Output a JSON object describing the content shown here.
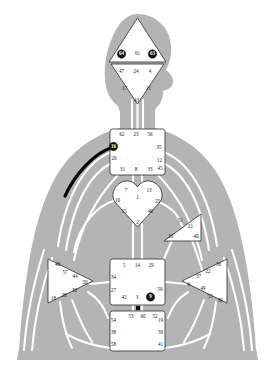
{
  "diagram": {
    "type": "bodygraph",
    "background_color": "#ffffff",
    "silhouette_color": "#b4b4b4",
    "center_fill": "#ffffff",
    "center_stroke": "#2b2b2b",
    "open_channel_color": "#ffffff",
    "defined_channel_color": "#000000",
    "defined_gate_fill": "#111111",
    "defined_gate_text": "#ffffff"
  },
  "centers": [
    {
      "id": "head",
      "name": "Head Center",
      "shape": "triangle-up",
      "defined": false,
      "gates": [
        {
          "num": "64",
          "x": 121.5,
          "y": 54.0,
          "on": true
        },
        {
          "num": "61",
          "x": 137.5,
          "y": 54.0,
          "on": false
        },
        {
          "num": "63",
          "x": 152.5,
          "y": 54.0,
          "on": true
        }
      ]
    },
    {
      "id": "ajna",
      "name": "Ajna Center",
      "shape": "triangle-down",
      "defined": false,
      "gates": [
        {
          "num": "47",
          "x": 121.5,
          "y": 71.5,
          "on": false
        },
        {
          "num": "24",
          "x": 136.0,
          "y": 71.5,
          "on": false
        },
        {
          "num": "4",
          "x": 150.0,
          "y": 71.5,
          "on": false
        },
        {
          "num": "17",
          "x": 124.5,
          "y": 88.5,
          "on": false
        },
        {
          "num": "11",
          "x": 148.5,
          "y": 88.5,
          "on": false
        },
        {
          "num": "43",
          "x": 136.5,
          "y": 100.5,
          "on": false
        }
      ]
    },
    {
      "id": "throat",
      "name": "Throat Center",
      "shape": "square",
      "defined": false,
      "gates": [
        {
          "num": "62",
          "x": 122.0,
          "y": 135.0,
          "on": false
        },
        {
          "num": "23",
          "x": 136.0,
          "y": 135.0,
          "on": false
        },
        {
          "num": "56",
          "x": 150.0,
          "y": 135.0,
          "on": false
        },
        {
          "num": "16",
          "x": 113.5,
          "y": 146.5,
          "on": true
        },
        {
          "num": "35",
          "x": 159.0,
          "y": 147.5,
          "on": false
        },
        {
          "num": "20",
          "x": 114.0,
          "y": 158.5,
          "on": false
        },
        {
          "num": "12",
          "x": 159.5,
          "y": 160.5,
          "on": false
        },
        {
          "num": "45",
          "x": 160.0,
          "y": 168.5,
          "on": false
        },
        {
          "num": "31",
          "x": 122.5,
          "y": 169.5,
          "on": false
        },
        {
          "num": "8",
          "x": 136.0,
          "y": 169.5,
          "on": false
        },
        {
          "num": "33",
          "x": 150.0,
          "y": 169.5,
          "on": false
        }
      ]
    },
    {
      "id": "g",
      "name": "G Center / Identity",
      "shape": "diamond-heart",
      "defined": false,
      "gates": [
        {
          "num": "7",
          "x": 126.0,
          "y": 190.5,
          "on": false
        },
        {
          "num": "13",
          "x": 149.0,
          "y": 190.5,
          "on": false
        },
        {
          "num": "1",
          "x": 137.5,
          "y": 197.5,
          "on": false
        },
        {
          "num": "10",
          "x": 117.5,
          "y": 201.0,
          "on": false
        },
        {
          "num": "25",
          "x": 157.5,
          "y": 201.5,
          "on": false
        },
        {
          "num": "15",
          "x": 124.0,
          "y": 211.5,
          "on": false
        },
        {
          "num": "46",
          "x": 150.5,
          "y": 211.5,
          "on": false
        },
        {
          "num": "2",
          "x": 137.5,
          "y": 222.5,
          "on": false
        }
      ]
    },
    {
      "id": "will",
      "name": "Heart / Ego Center",
      "shape": "triangle-left",
      "defined": false,
      "gates": [
        {
          "num": "51",
          "x": 180.5,
          "y": 220.5,
          "on": false
        },
        {
          "num": "21",
          "x": 190.5,
          "y": 227.0,
          "on": false
        },
        {
          "num": "26",
          "x": 170.5,
          "y": 236.5,
          "on": false
        },
        {
          "num": "40",
          "x": 196.0,
          "y": 236.5,
          "on": false
        }
      ]
    },
    {
      "id": "spleen",
      "name": "Spleen Center",
      "shape": "triangle-right",
      "defined": false,
      "gates": [
        {
          "num": "48",
          "x": 57.5,
          "y": 264.5,
          "on": false
        },
        {
          "num": "57",
          "x": 65.0,
          "y": 273.0,
          "on": false
        },
        {
          "num": "44",
          "x": 75.0,
          "y": 276.5,
          "on": false
        },
        {
          "num": "50",
          "x": 85.0,
          "y": 282.5,
          "on": false
        },
        {
          "num": "32",
          "x": 74.5,
          "y": 290.5,
          "on": false
        },
        {
          "num": "28",
          "x": 64.0,
          "y": 295.5,
          "on": false
        },
        {
          "num": "18",
          "x": 53.5,
          "y": 298.5,
          "on": false
        }
      ]
    },
    {
      "id": "solarplexus",
      "name": "Solar Plexus / Emotional Center",
      "shape": "triangle-left",
      "defined": false,
      "gates": [
        {
          "num": "36",
          "x": 218.5,
          "y": 264.5,
          "on": false
        },
        {
          "num": "22",
          "x": 208.0,
          "y": 271.5,
          "on": false
        },
        {
          "num": "37",
          "x": 198.5,
          "y": 277.0,
          "on": false
        },
        {
          "num": "6",
          "x": 189.0,
          "y": 284.5,
          "on": false
        },
        {
          "num": "49",
          "x": 203.0,
          "y": 288.5,
          "on": false
        },
        {
          "num": "55",
          "x": 210.0,
          "y": 296.5,
          "on": false
        },
        {
          "num": "30",
          "x": 220.0,
          "y": 300.5,
          "on": false
        }
      ]
    },
    {
      "id": "sacral",
      "name": "Sacral Center",
      "shape": "square",
      "defined": false,
      "gates": [
        {
          "num": "5",
          "x": 124.0,
          "y": 266.0,
          "on": false
        },
        {
          "num": "14",
          "x": 137.5,
          "y": 266.0,
          "on": false
        },
        {
          "num": "29",
          "x": 151.0,
          "y": 266.0,
          "on": false
        },
        {
          "num": "34",
          "x": 113.5,
          "y": 278.0,
          "on": false
        },
        {
          "num": "27",
          "x": 113.5,
          "y": 290.5,
          "on": false
        },
        {
          "num": "59",
          "x": 160.0,
          "y": 290.0,
          "on": false
        },
        {
          "num": "42",
          "x": 124.0,
          "y": 297.5,
          "on": false
        },
        {
          "num": "3",
          "x": 137.0,
          "y": 297.5,
          "on": false
        },
        {
          "num": "9",
          "x": 150.5,
          "y": 297.0,
          "on": true
        }
      ]
    },
    {
      "id": "root",
      "name": "Root Center",
      "shape": "square",
      "defined": false,
      "gates": [
        {
          "num": "53",
          "x": 131.0,
          "y": 317.0,
          "on": false
        },
        {
          "num": "60",
          "x": 143.0,
          "y": 317.0,
          "on": false
        },
        {
          "num": "52",
          "x": 155.0,
          "y": 317.0,
          "on": false
        },
        {
          "num": "54",
          "x": 113.5,
          "y": 320.5,
          "on": false
        },
        {
          "num": "19",
          "x": 160.5,
          "y": 320.5,
          "on": false
        },
        {
          "num": "38",
          "x": 113.5,
          "y": 333.0,
          "on": false
        },
        {
          "num": "39",
          "x": 160.5,
          "y": 333.0,
          "on": false
        },
        {
          "num": "58",
          "x": 113.5,
          "y": 344.5,
          "on": false
        },
        {
          "num": "41",
          "x": 160.5,
          "y": 344.5,
          "on": false
        }
      ]
    }
  ],
  "channels": {
    "defined": [
      {
        "id": "48-16",
        "label": "Channel 48-16 (Talent / The Wavelength)",
        "color": "#000000"
      }
    ],
    "defined_gates": [
      "64",
      "63",
      "16",
      "9"
    ]
  }
}
